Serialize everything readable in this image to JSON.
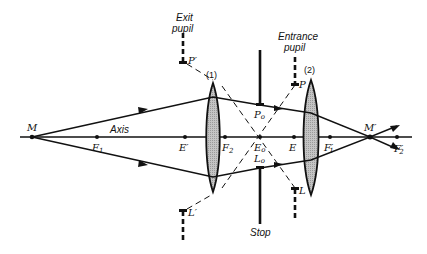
{
  "diagram": {
    "colors": {
      "ink": "#111111",
      "lens_fill": "#bdbdbd",
      "background": "#ffffff"
    },
    "axis_label": "Axis",
    "points": {
      "M": "M",
      "M_prime": "M′",
      "F1": "F",
      "F1_sub": "1",
      "F2": "F",
      "F2_sub": "2",
      "F1_prime": "F′",
      "F1_prime_sub": "1",
      "F2_prime": "F′",
      "F2_prime_sub": "2",
      "E_prime": "E′",
      "E0": "E",
      "E0_sub": "o",
      "E": "E",
      "P0": "P",
      "P0_sub": "o",
      "L0": "L",
      "L0_sub": "o",
      "P": "P",
      "L": "L",
      "P_prime": "P′",
      "L_prime": "L′"
    },
    "lenses": [
      {
        "id": "lens-1",
        "label": "(1)"
      },
      {
        "id": "lens-2",
        "label": "(2)"
      }
    ],
    "annotations": {
      "exit_pupil_line1": "Exit",
      "exit_pupil_line2": "pupil",
      "entrance_pupil_line1": "Entrance",
      "entrance_pupil_line2": "pupil",
      "stop": "Stop"
    }
  }
}
